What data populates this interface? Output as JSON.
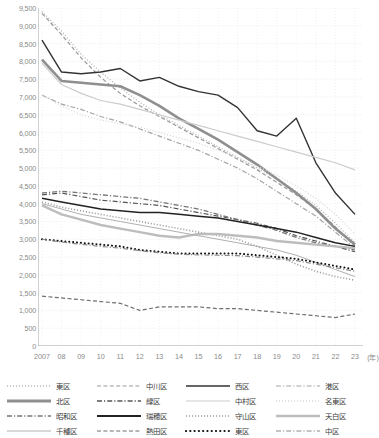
{
  "chart_data": {
    "type": "line",
    "title": "",
    "xlabel": "年",
    "ylabel": "",
    "ylim": [
      0,
      9500
    ],
    "ytick_step": 500,
    "grid": true,
    "legend_position": "bottom",
    "x": [
      "2007",
      "08",
      "09",
      "10",
      "11",
      "12",
      "13",
      "14",
      "15",
      "16",
      "17",
      "18",
      "19",
      "20",
      "21",
      "22",
      "23"
    ],
    "xtick_labels": [
      "2007",
      "08",
      "09",
      "10",
      "11",
      "12",
      "13",
      "14",
      "15",
      "16",
      "17",
      "18",
      "19",
      "20",
      "21",
      "22",
      "23"
    ],
    "x_unit_label": "(年)",
    "ytick_labels": [
      "0",
      "500",
      "1,000",
      "1,500",
      "2,000",
      "2,500",
      "3,000",
      "3,500",
      "4,000",
      "4,500",
      "5,000",
      "5,500",
      "6,000",
      "6,500",
      "7,000",
      "7,500",
      "8,000",
      "8,500",
      "9,000",
      "9,500"
    ],
    "series": [
      {
        "name": "東区",
        "style": "dotted",
        "color": "#b9b9b9",
        "width": 1.3,
        "values": [
          9400,
          8850,
          8200,
          7700,
          7250,
          6850,
          6500,
          6200,
          5900,
          5600,
          5300,
          5000,
          4700,
          4350,
          3950,
          3450,
          2900
        ]
      },
      {
        "name": "中川区",
        "style": "dashed",
        "color": "#9a9a9a",
        "width": 1.2,
        "values": [
          9350,
          8750,
          8100,
          7550,
          7100,
          6750,
          6450,
          6150,
          5850,
          5550,
          5250,
          4950,
          4600,
          4250,
          3850,
          3350,
          2800
        ]
      },
      {
        "name": "西区",
        "style": "solid",
        "color": "#333333",
        "width": 1.4,
        "values": [
          8600,
          7700,
          7650,
          7700,
          7800,
          7450,
          7550,
          7300,
          7150,
          7050,
          6700,
          6050,
          5900,
          6400,
          5150,
          4300,
          3700
        ]
      },
      {
        "name": "港区",
        "style": "dashdot",
        "color": "#a5a5a5",
        "width": 1.2,
        "values": [
          7050,
          6800,
          6650,
          6450,
          6300,
          6100,
          5900,
          5700,
          5500,
          5250,
          5000,
          4700,
          4350,
          4000,
          3650,
          3200,
          2750
        ]
      },
      {
        "name": "北区",
        "style": "solid",
        "color": "#8f8f8f",
        "width": 2.6,
        "values": [
          8050,
          7450,
          7400,
          7350,
          7300,
          7050,
          6750,
          6400,
          6100,
          5800,
          5450,
          5100,
          4700,
          4300,
          3850,
          3300,
          2850
        ]
      },
      {
        "name": "緑区",
        "style": "dashdot",
        "color": "#555555",
        "width": 1.2,
        "values": [
          4250,
          4300,
          4200,
          4100,
          4050,
          4000,
          3950,
          3850,
          3750,
          3650,
          3550,
          3450,
          3300,
          3100,
          2950,
          2800,
          2650
        ]
      },
      {
        "name": "中村区",
        "style": "solid",
        "color": "#cccccc",
        "width": 1.2,
        "values": [
          7950,
          7350,
          7100,
          6900,
          6800,
          6650,
          6500,
          6350,
          6200,
          6050,
          5900,
          5750,
          5600,
          5450,
          5300,
          5150,
          4950
        ]
      },
      {
        "name": "名東区",
        "style": "dotted",
        "color": "#d8d8d8",
        "width": 1.2,
        "values": [
          7050,
          6750,
          6500,
          6350,
          6250,
          6150,
          6000,
          5850,
          5700,
          5500,
          5300,
          5050,
          4800,
          4500,
          4150,
          3700,
          3150
        ]
      },
      {
        "name": "昭和区",
        "style": "dashdot",
        "color": "#777777",
        "width": 1.3,
        "values": [
          4300,
          4350,
          4300,
          4250,
          4200,
          4150,
          4050,
          3950,
          3850,
          3700,
          3550,
          3400,
          3250,
          3050,
          2900,
          2800,
          2700
        ]
      },
      {
        "name": "瑞穂区",
        "style": "solid",
        "color": "#222222",
        "width": 1.5,
        "values": [
          4150,
          4050,
          3950,
          3850,
          3800,
          3750,
          3750,
          3700,
          3650,
          3600,
          3500,
          3400,
          3300,
          3200,
          3050,
          2900,
          2800
        ]
      },
      {
        "name": "守山区",
        "style": "dotted",
        "color": "#9f9f9f",
        "width": 1.6,
        "values": [
          4050,
          3900,
          3800,
          3700,
          3600,
          3500,
          3400,
          3300,
          3200,
          3100,
          3000,
          2800,
          2550,
          2300,
          2100,
          1950,
          1850
        ]
      },
      {
        "name": "天白区",
        "style": "solid",
        "color": "#bdbdbd",
        "width": 2.4,
        "values": [
          3950,
          3700,
          3550,
          3400,
          3300,
          3200,
          3100,
          3050,
          3150,
          3150,
          3100,
          3050,
          2950,
          2900,
          2850,
          2800,
          2750
        ]
      },
      {
        "name": "千種区",
        "style": "solid",
        "color": "#b0b0b0",
        "width": 1.0,
        "values": [
          4000,
          3850,
          3700,
          3600,
          3500,
          3400,
          3300,
          3200,
          3100,
          3000,
          2900,
          2800,
          2700,
          2550,
          2350,
          2150,
          1950
        ]
      },
      {
        "name": "熱田区",
        "style": "dashed",
        "color": "#6f6f6f",
        "width": 1.2,
        "values": [
          1400,
          1350,
          1300,
          1250,
          1200,
          1000,
          1100,
          1100,
          1100,
          1050,
          1050,
          1000,
          950,
          900,
          850,
          800,
          900
        ]
      },
      {
        "name": "東区",
        "style": "thickdot",
        "color": "#111111",
        "width": 2.0,
        "values": [
          3000,
          2950,
          2900,
          2850,
          2800,
          2700,
          2650,
          2600,
          2600,
          2600,
          2600,
          2550,
          2500,
          2450,
          2350,
          2250,
          2150
        ]
      },
      {
        "name": "中区",
        "style": "dashdot",
        "color": "#8a8a8a",
        "width": 1.2,
        "values": [
          3000,
          2920,
          2860,
          2800,
          2750,
          2680,
          2620,
          2580,
          2560,
          2550,
          2540,
          2500,
          2450,
          2400,
          2300,
          2200,
          2100
        ]
      }
    ]
  },
  "legend": {
    "rows": [
      [
        {
          "label": "東区",
          "style": "dotted",
          "color": "#b9b9b9",
          "width": 1.3
        },
        {
          "label": "中川区",
          "style": "dashed",
          "color": "#9a9a9a",
          "width": 1.2
        },
        {
          "label": "西区",
          "style": "solid",
          "color": "#333333",
          "width": 1.6
        },
        {
          "label": "港区",
          "style": "dashdot",
          "color": "#a5a5a5",
          "width": 1.2
        }
      ],
      [
        {
          "label": "北区",
          "style": "solid",
          "color": "#8f8f8f",
          "width": 2.8
        },
        {
          "label": "緑区",
          "style": "dashdot",
          "color": "#555555",
          "width": 1.3
        },
        {
          "label": "中村区",
          "style": "solid",
          "color": "#cccccc",
          "width": 1.2
        },
        {
          "label": "名東区",
          "style": "dotted",
          "color": "#d8d8d8",
          "width": 1.3
        }
      ],
      [
        {
          "label": "昭和区",
          "style": "dashdot",
          "color": "#777777",
          "width": 1.3
        },
        {
          "label": "瑞穂区",
          "style": "solid",
          "color": "#222222",
          "width": 1.8
        },
        {
          "label": "守山区",
          "style": "dotted",
          "color": "#9f9f9f",
          "width": 1.6
        },
        {
          "label": "天白区",
          "style": "solid",
          "color": "#bdbdbd",
          "width": 2.4
        }
      ],
      [
        {
          "label": "千種区",
          "style": "solid",
          "color": "#b0b0b0",
          "width": 1.0
        },
        {
          "label": "熱田区",
          "style": "dashed",
          "color": "#6f6f6f",
          "width": 1.2
        },
        {
          "label": "東区",
          "style": "thickdot",
          "color": "#111111",
          "width": 2.2
        },
        {
          "label": "中区",
          "style": "dashdot",
          "color": "#8a8a8a",
          "width": 1.2
        }
      ]
    ]
  },
  "axis_colors": {
    "grid": "#e3e3e3",
    "axis": "#9a9a9a",
    "tick_text": "#8a8a8a"
  }
}
